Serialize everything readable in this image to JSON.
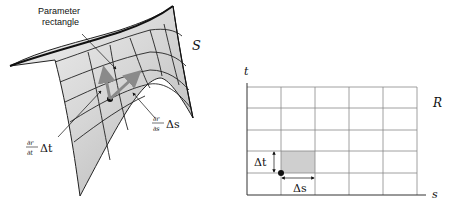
{
  "figure": {
    "surface_panel": {
      "surface_label": "S",
      "callout_line1": "Parameter",
      "callout_line2": "rectangle",
      "partial_t": {
        "numerator": "∂r",
        "denominator": "∂t",
        "delta": "Δt"
      },
      "partial_s": {
        "numerator": "∂r",
        "denominator": "∂s",
        "delta": "Δs"
      }
    },
    "parameter_panel": {
      "region_label": "R",
      "axis_vertical": "t",
      "axis_horizontal": "s",
      "delta_t": "Δt",
      "delta_s": "Δs",
      "grid_cols": 5,
      "grid_rows": 5
    },
    "colors": {
      "surface_fill": "#c8c8c8",
      "surface_light": "#ececec",
      "grid_line": "#888888",
      "highlight_cell": "#cfcfcf",
      "vector_gray": "#8a8a8a",
      "ink": "#111111"
    }
  }
}
